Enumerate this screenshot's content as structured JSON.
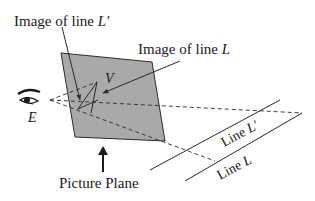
{
  "labels": {
    "image_of_line_lprime_prefix": "Image of line ",
    "image_of_line_lprime_var": "L′",
    "image_of_line_l_prefix": "Image of line ",
    "image_of_line_l_var": "L",
    "vanishing_point": "V",
    "eye_point": "E",
    "picture_plane": "Picture Plane",
    "line_lprime_prefix": "Line ",
    "line_lprime_var": "L′",
    "line_l_prefix": "Line ",
    "line_l_var": "L"
  },
  "colors": {
    "plane_fill": "#a9a9a9",
    "stroke": "#2a2a2a",
    "background": "#ffffff"
  },
  "icons": {
    "eye": "eye-icon",
    "arrow_up": "arrow-up-icon"
  }
}
